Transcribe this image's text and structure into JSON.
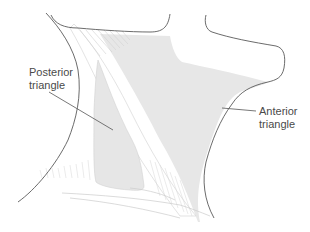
{
  "diagram": {
    "labels": {
      "posterior": {
        "line1": "Posterior",
        "line2": "triangle"
      },
      "anterior": {
        "line1": "Anterior",
        "line2": "triangle"
      }
    },
    "colors": {
      "background": "#ffffff",
      "outline": "#5a5a5a",
      "shading": "#e6e6e6",
      "muscle_fibers": "#d2d2d2",
      "label_text": "#4a4a4a",
      "leader_line": "#555555"
    },
    "regions": [
      {
        "name": "posterior-triangle",
        "shaded": true
      },
      {
        "name": "anterior-triangle",
        "shaded": true
      },
      {
        "name": "sternocleidomastoid-muscle",
        "shaded": false
      },
      {
        "name": "trapezius-muscle",
        "shaded": false
      }
    ]
  }
}
